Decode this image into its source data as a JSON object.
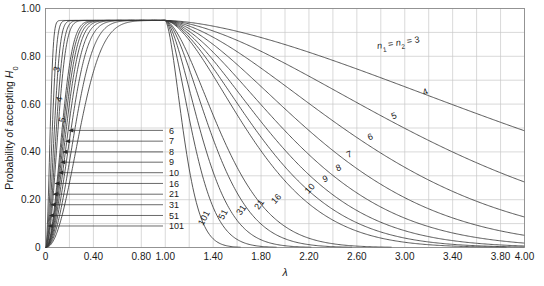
{
  "chart_data": {
    "type": "line",
    "title": "",
    "xlabel": "λ",
    "ylabel": "Probability of accepting H0",
    "ylabel_base": "Probability of accepting ",
    "ylabel_sym": "H",
    "ylabel_sub": "0",
    "xlim": [
      0,
      4.0
    ],
    "ylim": [
      0,
      1.0
    ],
    "grid": true,
    "grid_x_step": 0.2,
    "grid_y_step": 0.1,
    "legend_position": "inline-curve-labels",
    "xticks": [
      0,
      0.4,
      0.8,
      1.0,
      1.4,
      1.8,
      2.2,
      2.6,
      3.0,
      3.4,
      3.8,
      4.0
    ],
    "xticklabels": [
      "0",
      "0.40",
      "0.80",
      "1.00",
      "1.40",
      "1.80",
      "2.20",
      "2.60",
      "3.00",
      "3.40",
      "3.80",
      "4.00"
    ],
    "yticks": [
      0,
      0.2,
      0.4,
      0.6,
      0.8,
      1.0
    ],
    "yticklabels": [
      "0",
      "0.20",
      "0.40",
      "0.60",
      "0.80",
      "1.00"
    ],
    "peak_value": 0.95,
    "peak_x": 1.0,
    "annotation": {
      "text_parts": [
        "n",
        "1",
        " = ",
        "n",
        "2",
        " = 3"
      ],
      "plain": "n1 = n2 = 3",
      "x": 2.95,
      "y": 0.845
    },
    "series": [
      {
        "name": "3",
        "n": 3,
        "rise_scale": 0.3,
        "fall_scale": 0.085,
        "label_left": "3",
        "label_right": "n1 = n2 = 3"
      },
      {
        "name": "4",
        "n": 4,
        "rise_scale": 0.255,
        "fall_scale": 0.125,
        "label_left": "4",
        "label_right": "4"
      },
      {
        "name": "5",
        "n": 5,
        "rise_scale": 0.222,
        "fall_scale": 0.168,
        "label_left": "5",
        "label_right": "5"
      },
      {
        "name": "6",
        "n": 6,
        "rise_scale": 0.198,
        "fall_scale": 0.212,
        "label_left": "6",
        "label_right": "6"
      },
      {
        "name": "7",
        "n": 7,
        "rise_scale": 0.18,
        "fall_scale": 0.255,
        "label_left": "7",
        "label_right": "7"
      },
      {
        "name": "8",
        "n": 8,
        "rise_scale": 0.166,
        "fall_scale": 0.296,
        "label_left": "8",
        "label_right": "8"
      },
      {
        "name": "9",
        "n": 9,
        "rise_scale": 0.154,
        "fall_scale": 0.335,
        "label_left": "9",
        "label_right": "9"
      },
      {
        "name": "10",
        "n": 10,
        "rise_scale": 0.144,
        "fall_scale": 0.372,
        "label_left": "10",
        "label_right": "10"
      },
      {
        "name": "16",
        "n": 16,
        "rise_scale": 0.109,
        "fall_scale": 0.56,
        "label_left": "16",
        "label_right": "16"
      },
      {
        "name": "21",
        "n": 21,
        "rise_scale": 0.094,
        "fall_scale": 0.68,
        "label_left": "21",
        "label_right": "21"
      },
      {
        "name": "31",
        "n": 31,
        "rise_scale": 0.077,
        "fall_scale": 0.87,
        "label_left": "31",
        "label_right": "31"
      },
      {
        "name": "51",
        "n": 51,
        "rise_scale": 0.059,
        "fall_scale": 1.15,
        "label_left": "51",
        "label_right": "51"
      },
      {
        "name": "101",
        "n": 101,
        "rise_scale": 0.041,
        "fall_scale": 1.7,
        "label_left": "101",
        "label_right": "101"
      }
    ],
    "leader_labels": [
      {
        "label": "6",
        "y": 0.49
      },
      {
        "label": "7",
        "y": 0.445
      },
      {
        "label": "8",
        "y": 0.4
      },
      {
        "label": "9",
        "y": 0.357
      },
      {
        "label": "10",
        "y": 0.313
      },
      {
        "label": "16",
        "y": 0.268
      },
      {
        "label": "21",
        "y": 0.223
      },
      {
        "label": "31",
        "y": 0.179
      },
      {
        "label": "51",
        "y": 0.134
      },
      {
        "label": "101",
        "y": 0.09
      }
    ],
    "left_curve_labels": [
      {
        "label": "3",
        "x": 0.118,
        "y": 0.742
      },
      {
        "label": "4",
        "x": 0.138,
        "y": 0.617
      },
      {
        "label": "5",
        "x": 0.163,
        "y": 0.53
      }
    ],
    "right_curve_labels": [
      {
        "label": "4",
        "x": 3.18,
        "y": 0.64
      },
      {
        "label": "5",
        "x": 2.92,
        "y": 0.54
      },
      {
        "label": "6",
        "x": 2.72,
        "y": 0.452
      },
      {
        "label": "7",
        "x": 2.545,
        "y": 0.378
      },
      {
        "label": "8",
        "x": 2.455,
        "y": 0.322
      },
      {
        "label": "9",
        "x": 2.345,
        "y": 0.276
      },
      {
        "label": "10",
        "x": 2.225,
        "y": 0.238
      },
      {
        "label": "16",
        "x": 1.945,
        "y": 0.196
      },
      {
        "label": "21",
        "x": 1.805,
        "y": 0.173
      },
      {
        "label": "31",
        "x": 1.655,
        "y": 0.15
      },
      {
        "label": "51",
        "x": 1.505,
        "y": 0.133
      },
      {
        "label": "101",
        "x": 1.345,
        "y": 0.118
      }
    ]
  }
}
